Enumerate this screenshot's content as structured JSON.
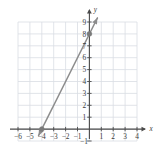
{
  "chart_data": {
    "type": "line",
    "title": "",
    "subtitle": "",
    "xlabel": "x",
    "ylabel": "y",
    "xlim": [
      -6.5,
      4.5
    ],
    "ylim": [
      -1.5,
      9.5
    ],
    "grid": true,
    "legend": false,
    "legend_position": "none",
    "x_ticks": [
      -6,
      -5,
      -4,
      -3,
      -2,
      -1,
      1,
      2,
      3,
      4
    ],
    "x_tick_labels": [
      "−6",
      "−5",
      "−4",
      "−3",
      "−2",
      "−1",
      "1",
      "2",
      "3",
      "4"
    ],
    "y_ticks": [
      -1,
      1,
      2,
      3,
      4,
      5,
      6,
      7,
      8,
      9
    ],
    "y_tick_labels": [
      "−1",
      "1",
      "2",
      "3",
      "4",
      "5",
      "6",
      "7",
      "8",
      "9"
    ],
    "grid_x_range": [
      -6,
      4
    ],
    "grid_y_range": [
      -1,
      9
    ],
    "series": [
      {
        "name": "line",
        "equation": "y = 2x + 8",
        "slope": 2,
        "intercept": 8,
        "x": [
          -4,
          0
        ],
        "values": [
          0,
          8
        ],
        "color": "#8c8c8c",
        "arrow_start": true,
        "arrow_end": true
      }
    ],
    "points": [
      {
        "label": "x-intercept",
        "x": -4,
        "y": 0
      },
      {
        "label": "y-intercept",
        "x": 0,
        "y": 8
      }
    ],
    "annotations": []
  },
  "colors": {
    "grid": "#d9dde3",
    "axis": "#4a4a4a",
    "line": "#8e8e8e",
    "point": "#7a7a7a",
    "tick_text": "#3b3b3b",
    "background": "#ffffff"
  },
  "axis_labels": {
    "x": "x",
    "y": "y"
  }
}
